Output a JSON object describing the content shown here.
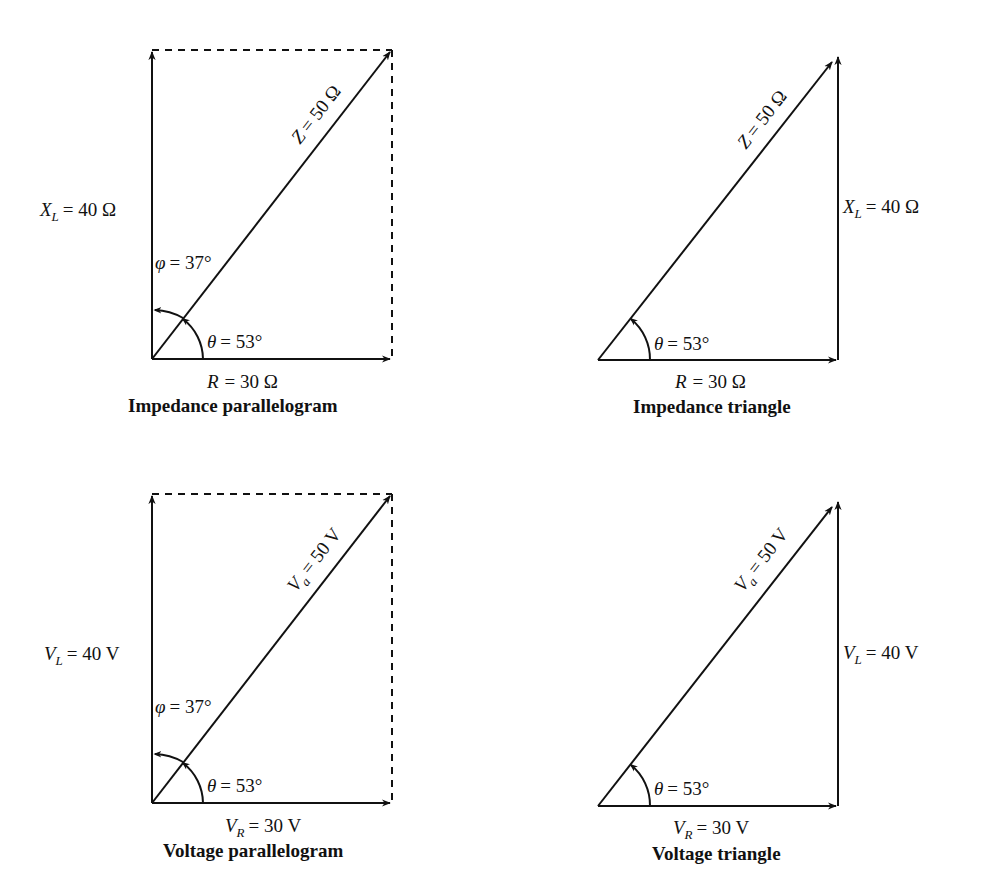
{
  "diagrams": [
    {
      "id": "impedance-parallelogram",
      "caption": "Impedance parallelogram",
      "horizontal": {
        "symbol": "R",
        "subscript": "",
        "value": "= 30 Ω"
      },
      "vertical": {
        "symbol": "X",
        "subscript": "L",
        "value": "= 40 Ω"
      },
      "hypotenuse": {
        "symbol": "Z",
        "subscript": "",
        "value": "= 50 Ω"
      },
      "theta": {
        "symbol": "θ",
        "value": "= 53°"
      },
      "phi": {
        "symbol": "φ",
        "value": "= 37°"
      }
    },
    {
      "id": "impedance-triangle",
      "caption": "Impedance triangle",
      "horizontal": {
        "symbol": "R",
        "subscript": "",
        "value": "= 30 Ω"
      },
      "vertical": {
        "symbol": "X",
        "subscript": "L",
        "value": "= 40 Ω"
      },
      "hypotenuse": {
        "symbol": "Z",
        "subscript": "",
        "value": "= 50 Ω"
      },
      "theta": {
        "symbol": "θ",
        "value": "= 53°"
      }
    },
    {
      "id": "voltage-parallelogram",
      "caption": "Voltage parallelogram",
      "horizontal": {
        "symbol": "V",
        "subscript": "R",
        "value": "= 30 V"
      },
      "vertical": {
        "symbol": "V",
        "subscript": "L",
        "value": "= 40 V"
      },
      "hypotenuse": {
        "symbol": "V",
        "subscript": "a",
        "value": "= 50 V"
      },
      "theta": {
        "symbol": "θ",
        "value": "= 53°"
      },
      "phi": {
        "symbol": "φ",
        "value": "= 37°"
      }
    },
    {
      "id": "voltage-triangle",
      "caption": "Voltage triangle",
      "horizontal": {
        "symbol": "V",
        "subscript": "R",
        "value": "= 30 V"
      },
      "vertical": {
        "symbol": "V",
        "subscript": "L",
        "value": "= 40 V"
      },
      "hypotenuse": {
        "symbol": "V",
        "subscript": "a",
        "value": "= 50 V"
      },
      "theta": {
        "symbol": "θ",
        "value": "= 53°"
      }
    }
  ],
  "colors": {
    "stroke": "#111111",
    "background": "#ffffff"
  }
}
